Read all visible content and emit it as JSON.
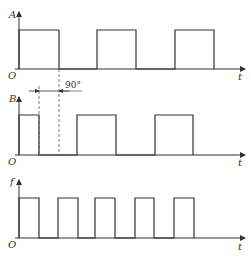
{
  "diagram": {
    "type": "timing-diagram",
    "annotation": "90°",
    "plots": [
      {
        "name": "A",
        "y_label": "A",
        "x_label": "t",
        "origin_label": "O",
        "pulses": [
          [
            19,
            59
          ],
          [
            97,
            136
          ],
          [
            175,
            214
          ]
        ]
      },
      {
        "name": "B",
        "y_label": "B",
        "x_label": "t",
        "origin_label": "O",
        "pulses": [
          [
            19,
            39
          ],
          [
            77,
            116
          ],
          [
            155,
            193
          ]
        ]
      },
      {
        "name": "f",
        "y_label": "f",
        "x_label": "t",
        "origin_label": "O",
        "pulses": [
          [
            19,
            39
          ],
          [
            58,
            78
          ],
          [
            95,
            115
          ],
          [
            135,
            154
          ],
          [
            174,
            194
          ]
        ]
      }
    ]
  }
}
